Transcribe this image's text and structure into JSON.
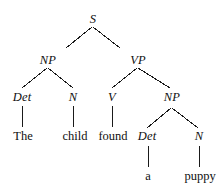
{
  "figure": {
    "type": "syntax-tree",
    "sentence": "The child found a puppy",
    "width": 222,
    "height": 192,
    "line_color": "#1a1a1a",
    "text_color": "#101010"
  },
  "nodes": [
    {
      "id": "s",
      "label": "S",
      "kind": "nonterminal",
      "x": 93,
      "y": 19
    },
    {
      "id": "np1",
      "label": "NP",
      "kind": "nonterminal",
      "x": 48,
      "y": 60
    },
    {
      "id": "vp",
      "label": "VP",
      "kind": "nonterminal",
      "x": 138,
      "y": 60
    },
    {
      "id": "det1",
      "label": "Det",
      "kind": "nonterminal",
      "x": 22,
      "y": 97
    },
    {
      "id": "n1",
      "label": "N",
      "kind": "nonterminal",
      "x": 73,
      "y": 97
    },
    {
      "id": "v",
      "label": "V",
      "kind": "nonterminal",
      "x": 112,
      "y": 97
    },
    {
      "id": "np2",
      "label": "NP",
      "kind": "nonterminal",
      "x": 172,
      "y": 97
    },
    {
      "id": "the",
      "label": "The",
      "kind": "terminal",
      "x": 23,
      "y": 136
    },
    {
      "id": "child",
      "label": "child",
      "kind": "terminal",
      "x": 75,
      "y": 136
    },
    {
      "id": "found",
      "label": "found",
      "kind": "terminal",
      "x": 113,
      "y": 136
    },
    {
      "id": "det2",
      "label": "Det",
      "kind": "nonterminal",
      "x": 147,
      "y": 136
    },
    {
      "id": "n2",
      "label": "N",
      "kind": "nonterminal",
      "x": 199,
      "y": 136
    },
    {
      "id": "a",
      "label": "a",
      "kind": "terminal",
      "x": 148,
      "y": 176
    },
    {
      "id": "puppy",
      "label": "puppy",
      "kind": "terminal",
      "x": 200,
      "y": 176
    }
  ],
  "edges": [
    {
      "id": "s-np1",
      "from": "S",
      "to": "NP",
      "x1": 92,
      "y1": 27,
      "x2": 66,
      "y2": 48
    },
    {
      "id": "s-vp",
      "from": "S",
      "to": "VP",
      "x1": 93,
      "y1": 27,
      "x2": 120,
      "y2": 48
    },
    {
      "id": "np1-det1",
      "from": "NP",
      "to": "Det",
      "x1": 47,
      "y1": 68,
      "x2": 22,
      "y2": 88
    },
    {
      "id": "np1-n1",
      "from": "NP",
      "to": "N",
      "x1": 48,
      "y1": 68,
      "x2": 73,
      "y2": 88
    },
    {
      "id": "vp-v",
      "from": "VP",
      "to": "V",
      "x1": 137,
      "y1": 68,
      "x2": 112,
      "y2": 88
    },
    {
      "id": "vp-np2",
      "from": "VP",
      "to": "NP",
      "x1": 138,
      "y1": 68,
      "x2": 170,
      "y2": 88
    },
    {
      "id": "det1-the",
      "from": "Det",
      "to": "The",
      "x1": 22,
      "y1": 106,
      "x2": 22,
      "y2": 127
    },
    {
      "id": "n1-child",
      "from": "N",
      "to": "child",
      "x1": 73,
      "y1": 106,
      "x2": 73,
      "y2": 127
    },
    {
      "id": "v-found",
      "from": "V",
      "to": "found",
      "x1": 112,
      "y1": 106,
      "x2": 112,
      "y2": 127
    },
    {
      "id": "np2-det2",
      "from": "NP",
      "to": "Det",
      "x1": 171,
      "y1": 108,
      "x2": 147,
      "y2": 128
    },
    {
      "id": "np2-n2",
      "from": "NP",
      "to": "N",
      "x1": 172,
      "y1": 108,
      "x2": 198,
      "y2": 128
    },
    {
      "id": "det2-a",
      "from": "Det",
      "to": "a",
      "x1": 148,
      "y1": 146,
      "x2": 148,
      "y2": 167
    },
    {
      "id": "n2-puppy",
      "from": "N",
      "to": "puppy",
      "x1": 199,
      "y1": 146,
      "x2": 199,
      "y2": 167
    }
  ]
}
